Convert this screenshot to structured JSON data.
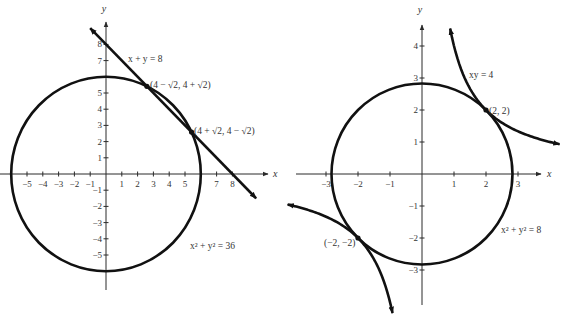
{
  "chart_data": [
    {
      "type": "line",
      "title": "",
      "xlabel": "x",
      "ylabel": "y",
      "xlim": [
        -5.6,
        10.2
      ],
      "ylim": [
        -7,
        9.4
      ],
      "x_ticks": [
        -5,
        -4,
        -3,
        -2,
        -1,
        1,
        2,
        3,
        4,
        5,
        7,
        8
      ],
      "y_ticks": [
        -5,
        -4,
        -3,
        -2,
        -1,
        1,
        2,
        3,
        4,
        5,
        7,
        8
      ],
      "curves": [
        {
          "name": "circle",
          "kind": "circle",
          "equation": "x² + y² = 36",
          "radius": 6
        },
        {
          "name": "line",
          "kind": "line",
          "equation": "x + y = 8",
          "x_range": [
            -1,
            9.5
          ]
        }
      ],
      "points": [
        {
          "label": "(4 − √2, 4 + √2)",
          "x": 2.586,
          "y": 5.414
        },
        {
          "label": "(4 + √2, 4 − √2)",
          "x": 5.414,
          "y": 2.586
        }
      ],
      "annotations": [
        {
          "text": "x + y = 8",
          "near": "line"
        },
        {
          "text": "x² + y² = 36",
          "near": "circle"
        }
      ]
    },
    {
      "type": "line",
      "title": "",
      "xlabel": "x",
      "ylabel": "y",
      "xlim": [
        -3.9,
        3.7
      ],
      "ylim": [
        -4.1,
        4.6
      ],
      "x_ticks": [
        -3,
        -2,
        -1,
        1,
        2,
        3
      ],
      "y_ticks": [
        -3,
        -2,
        -1,
        1,
        2,
        3,
        4
      ],
      "curves": [
        {
          "name": "circle",
          "kind": "circle",
          "equation": "x² + y² = 8",
          "radius": 2.828
        },
        {
          "name": "hyperbola",
          "kind": "hyperbola",
          "equation": "xy = 4",
          "x_range_pos": [
            0.88,
            4.3
          ],
          "x_range_neg": [
            -4.2,
            -0.92
          ]
        }
      ],
      "points": [
        {
          "label": "(2, 2)",
          "x": 2,
          "y": 2
        },
        {
          "label": "(−2, −2)",
          "x": -2,
          "y": -2
        }
      ],
      "annotations": [
        {
          "text": "xy = 4",
          "near": "hyperbola"
        },
        {
          "text": "x² + y² = 8",
          "near": "circle"
        }
      ]
    }
  ]
}
